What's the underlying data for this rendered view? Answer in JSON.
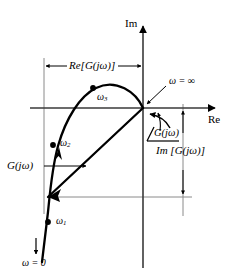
{
  "figure": {
    "type": "polar-plot"
  },
  "axes": {
    "imaginary_label": "Im",
    "real_label": "Re",
    "origin": {
      "x": 143,
      "y": 108
    }
  },
  "annotations": {
    "re_component": "Re[G(jω)]",
    "im_component": "Im [G(jω)]",
    "vector_label": "G(jω)",
    "angle_label": "G(jω)",
    "angle_symbol": "∠",
    "omega_zero": "ω = 0",
    "omega_infinity": "ω = ∞"
  },
  "curve_points": [
    {
      "name": "omega-1",
      "label_base": "ω",
      "label_sub": "1",
      "x": 48,
      "y": 222
    },
    {
      "name": "omega-2",
      "label_base": "ω",
      "label_sub": "2",
      "x": 53,
      "y": 145
    },
    {
      "name": "omega-3",
      "label_base": "ω",
      "label_sub": "3",
      "x": 93,
      "y": 88
    }
  ],
  "colors": {
    "ink": "#000000",
    "guide": "#808080",
    "background": "#ffffff"
  }
}
